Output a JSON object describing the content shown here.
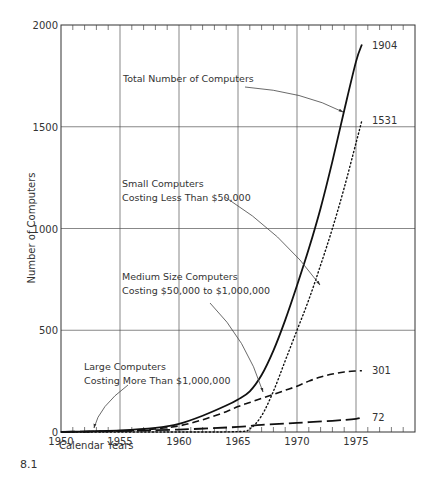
{
  "figure_label": "8.1",
  "chart_data": {
    "type": "line",
    "title": "",
    "xlabel": "Calendar Years",
    "ylabel": "Number of Computers",
    "xlim": [
      1950,
      1980
    ],
    "ylim": [
      0,
      2000
    ],
    "x_ticks": [
      1950,
      1955,
      1960,
      1965,
      1970,
      1975
    ],
    "y_ticks": [
      0,
      500,
      1000,
      1500,
      2000
    ],
    "grid": true,
    "legend": "annotations",
    "series": [
      {
        "name": "Total Number of Computers",
        "style": "solid",
        "x": [
          1950,
          1955,
          1958,
          1960,
          1962,
          1964,
          1965,
          1966,
          1967,
          1968,
          1969,
          1970,
          1971,
          1972,
          1973,
          1974,
          1975,
          1975.5
        ],
        "values": [
          0,
          8,
          20,
          40,
          80,
          130,
          160,
          200,
          280,
          400,
          550,
          720,
          900,
          1100,
          1330,
          1580,
          1820,
          1904
        ],
        "end_label": "1904"
      },
      {
        "name": "Small Computers Costing Less Than $50,000",
        "style": "dotted",
        "x": [
          1950,
          1960,
          1965,
          1966,
          1967,
          1968,
          1969,
          1970,
          1971,
          1972,
          1973,
          1974,
          1975,
          1975.5
        ],
        "values": [
          0,
          0,
          2,
          15,
          80,
          200,
          350,
          500,
          650,
          820,
          1000,
          1200,
          1420,
          1531
        ],
        "end_label": "1531"
      },
      {
        "name": "Medium Size Computers Costing $50,000 to $1,000,000",
        "style": "dashed",
        "x": [
          1950,
          1955,
          1958,
          1960,
          1962,
          1964,
          1965,
          1966,
          1967,
          1968,
          1969,
          1970,
          1971,
          1972,
          1973,
          1974,
          1975,
          1975.5
        ],
        "values": [
          0,
          5,
          15,
          30,
          60,
          100,
          125,
          145,
          165,
          185,
          205,
          225,
          250,
          270,
          285,
          295,
          300,
          301
        ],
        "end_label": "301"
      },
      {
        "name": "Large Computers Costing More Than $1,000,000",
        "style": "long-dash",
        "x": [
          1950,
          1955,
          1960,
          1965,
          1967,
          1970,
          1973,
          1975,
          1975.5
        ],
        "values": [
          0,
          5,
          12,
          25,
          35,
          45,
          55,
          65,
          72
        ],
        "end_label": "72"
      }
    ],
    "annotations": [
      {
        "lines": [
          "Total Number of Computers"
        ],
        "target_series": 0
      },
      {
        "lines": [
          "Small Computers",
          "Costing Less Than  $50,000"
        ],
        "target_series": 1
      },
      {
        "lines": [
          "Medium Size Computers",
          "Costing $50,000 to $1,000,000"
        ],
        "target_series": 2
      },
      {
        "lines": [
          "Large Computers",
          "Costing More Than $1,000,000"
        ],
        "target_series": 3
      }
    ]
  }
}
